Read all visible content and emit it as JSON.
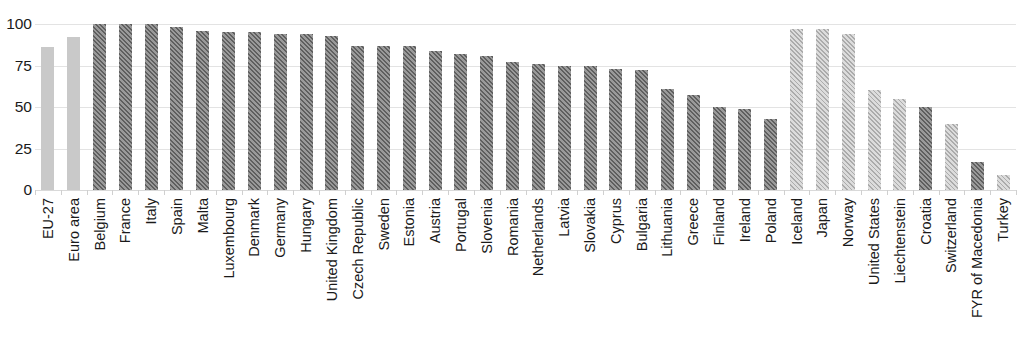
{
  "chart_data": {
    "type": "bar",
    "title": "",
    "subtitle": "",
    "xlabel": "",
    "ylabel": "",
    "ylim": [
      0,
      100
    ],
    "yticks": [
      0,
      25,
      50,
      75,
      100
    ],
    "ytick_labels": [
      "0",
      "25",
      "50",
      "75",
      "100"
    ],
    "grid": true,
    "legend": "none",
    "orientation": "vertical",
    "bar_style_by_group": {
      "aggregate": "solid light grey",
      "eu-member": "dark diagonal hatch",
      "non-eu": "light diagonal hatch"
    },
    "colors": {
      "aggregate": "#c9c9c9",
      "eu_member_hatch": "#5f5f5f",
      "eu_member_fill": "#9a9a9a",
      "non_eu_hatch": "#ababab",
      "non_eu_fill": "#dcdcdc",
      "gridline": "#e3e3e3",
      "text": "#1a1a1a",
      "background": "#ffffff"
    },
    "categories": [
      "EU-27",
      "Euro area",
      "Belgium",
      "France",
      "Italy",
      "Spain",
      "Malta",
      "Luxembourg",
      "Denmark",
      "Germany",
      "Hungary",
      "United Kingdom",
      "Czech Republic",
      "Sweden",
      "Estonia",
      "Austria",
      "Portugal",
      "Slovenia",
      "Romania",
      "Netherlands",
      "Latvia",
      "Slovakia",
      "Cyprus",
      "Bulgaria",
      "Lithuania",
      "Greece",
      "Finland",
      "Ireland",
      "Poland",
      "Iceland",
      "Japan",
      "Norway",
      "United States",
      "Liechtenstein",
      "Croatia",
      "Switzerland",
      "FYR of Macedonia",
      "Turkey"
    ],
    "values": [
      86,
      92,
      100,
      100,
      100,
      98,
      96,
      95,
      95,
      94,
      94,
      93,
      87,
      87,
      87,
      84,
      82,
      81,
      77,
      76,
      75,
      75,
      73,
      72,
      61,
      57,
      50,
      49,
      43,
      97,
      97,
      94,
      60,
      55,
      50,
      40,
      17,
      9
    ],
    "groups": [
      "aggregate",
      "aggregate",
      "eu-member",
      "eu-member",
      "eu-member",
      "eu-member",
      "eu-member",
      "eu-member",
      "eu-member",
      "eu-member",
      "eu-member",
      "eu-member",
      "eu-member",
      "eu-member",
      "eu-member",
      "eu-member",
      "eu-member",
      "eu-member",
      "eu-member",
      "eu-member",
      "eu-member",
      "eu-member",
      "eu-member",
      "eu-member",
      "eu-member",
      "eu-member",
      "eu-member",
      "eu-member",
      "eu-member",
      "non-eu",
      "non-eu",
      "non-eu",
      "non-eu",
      "non-eu",
      "eu-member",
      "non-eu",
      "eu-member",
      "non-eu"
    ]
  }
}
